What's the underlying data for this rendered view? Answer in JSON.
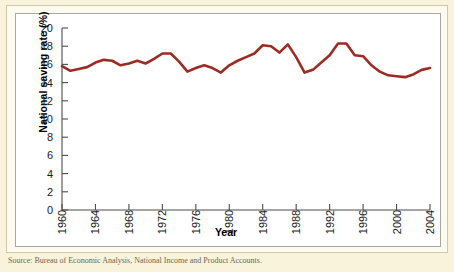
{
  "figure": {
    "caption": "Source: Bureau of Economic Analysis, National Income and Product Accounts.",
    "background_color": "#f8f3da",
    "panel_color": "#ffffff",
    "line_color": "#9e2b23",
    "axis_color": "#4d4d4d"
  },
  "chart_data": {
    "type": "line",
    "title": "",
    "xlabel": "Year",
    "ylabel": "National saving rate (%)",
    "xlim": [
      1960,
      2004
    ],
    "ylim": [
      0,
      20
    ],
    "ytick_step": 2,
    "xtick_step": 4,
    "grid": false,
    "legend": "none",
    "yticks": [
      0,
      2,
      4,
      6,
      8,
      10,
      12,
      14,
      16,
      18,
      20
    ],
    "xticks": [
      1960,
      1964,
      1968,
      1972,
      1976,
      1980,
      1984,
      1988,
      1992,
      1996,
      2000,
      2004
    ],
    "series": [
      {
        "name": "National saving rate",
        "color": "#9e2b23",
        "x": [
          1960,
          1961,
          1962,
          1963,
          1964,
          1965,
          1966,
          1967,
          1968,
          1969,
          1970,
          1971,
          1972,
          1973,
          1974,
          1975,
          1976,
          1977,
          1978,
          1979,
          1980,
          1981,
          1982,
          1983,
          1984,
          1985,
          1986,
          1987,
          1988,
          1989,
          1990,
          1991,
          1992,
          1993,
          1994,
          1995,
          1996,
          1997,
          1998,
          1999,
          2000,
          2001,
          2002,
          2003,
          2004
        ],
        "values": [
          15.8,
          15.3,
          15.5,
          15.7,
          16.2,
          16.5,
          16.4,
          15.9,
          16.1,
          16.4,
          16.1,
          16.6,
          17.2,
          17.2,
          16.3,
          15.2,
          15.6,
          15.9,
          15.6,
          15.1,
          15.9,
          16.4,
          16.8,
          17.2,
          18.1,
          18.0,
          17.3,
          18.2,
          16.8,
          15.1,
          15.4,
          16.2,
          17.0,
          18.3,
          18.3,
          17.0,
          16.9,
          15.9,
          15.2,
          14.8,
          14.7,
          14.6,
          14.9,
          15.4,
          15.6
        ]
      }
    ]
  }
}
